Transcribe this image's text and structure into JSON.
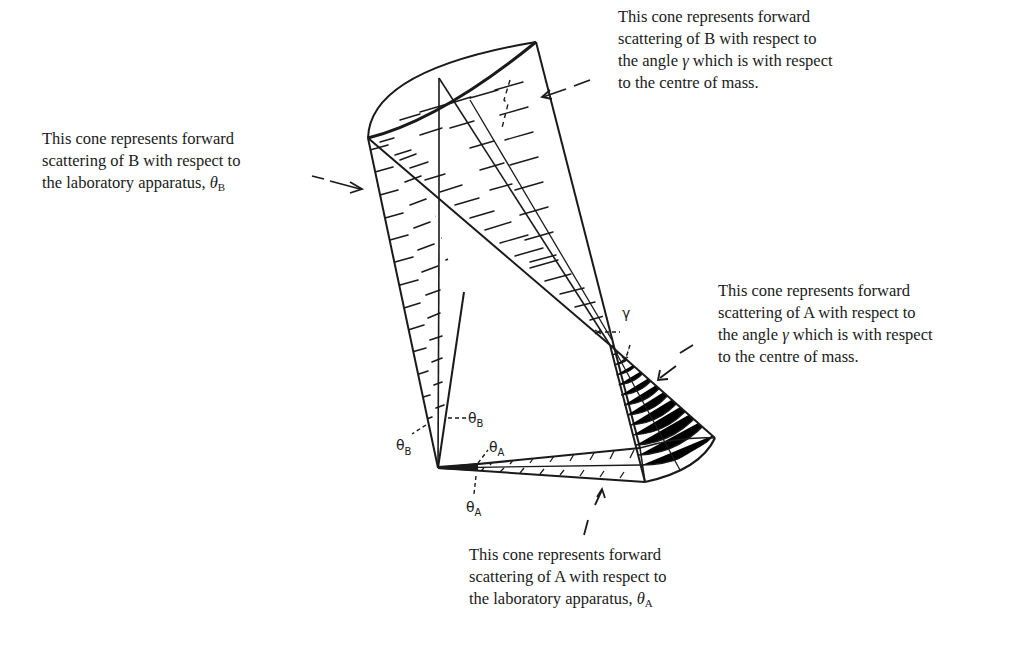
{
  "diagram": {
    "labels": {
      "b_cm": {
        "line1": "This cone represents forward",
        "line2": "scattering of B with respect to",
        "line3_pre": "the angle ",
        "line3_symbol": "γ",
        "line3_post": " which is with respect",
        "line4": "to the centre of mass."
      },
      "b_lab": {
        "line1": "This cone represents forward",
        "line2": "scattering of B with respect to",
        "line3_pre": "the laboratory apparatus, ",
        "symbol": "θ",
        "subscript": "B"
      },
      "a_cm": {
        "line1": "This cone represents forward",
        "line2": "scattering of A with respect to",
        "line3_pre": "the angle ",
        "line3_symbol": "γ",
        "line3_post": " which is with respect",
        "line4": "to the centre of mass."
      },
      "a_lab": {
        "line1": "This cone represents forward",
        "line2": "scattering of A with respect to",
        "line3_pre": "the laboratory apparatus, ",
        "symbol": "θ",
        "subscript": "A"
      }
    },
    "angle_markers": {
      "gamma": "γ",
      "theta_b_left": {
        "symbol": "θ",
        "sub": "B"
      },
      "theta_b_right": {
        "symbol": "θ",
        "sub": "B"
      },
      "theta_a_top": {
        "symbol": "θ",
        "sub": "A"
      },
      "theta_a_bottom": {
        "symbol": "θ",
        "sub": "A"
      }
    },
    "colors": {
      "ink": "#1a1a1a",
      "background": "#ffffff"
    }
  }
}
